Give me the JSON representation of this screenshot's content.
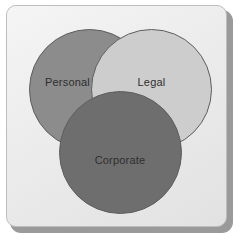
{
  "figure": {
    "type": "venn-diagram",
    "set_count": 3,
    "background_color": "#e9e9e9",
    "frame_border_color": "#bdbdbd",
    "shadow_color": "#9a9a9a",
    "outline_color": "#5e5e5e",
    "label_color": "#2e2e2e"
  },
  "chart_data": {
    "type": "venn",
    "title": "",
    "subtitle": "",
    "xlabel": "",
    "ylabel": "",
    "legend": [],
    "grid": false,
    "sets": [
      {
        "id": "personal",
        "label": "Personal",
        "color": "#8c8c8c",
        "outline": "#5e5e5e",
        "center_x": 89,
        "center_y": 89,
        "radius": 60,
        "z_order": 1
      },
      {
        "id": "legal",
        "label": "Legal",
        "color": "#cdcdcd",
        "outline": "#5e5e5e",
        "center_x": 151,
        "center_y": 89,
        "radius": 60,
        "z_order": 2
      },
      {
        "id": "corporate",
        "label": "Corporate",
        "color": "#6e6e6e",
        "outline": "#5e5e5e",
        "center_x": 120,
        "center_y": 152,
        "radius": 61,
        "z_order": 3
      }
    ],
    "overlaps": [
      {
        "sets": [
          "personal",
          "legal"
        ],
        "label": ""
      },
      {
        "sets": [
          "legal",
          "corporate"
        ],
        "label": ""
      },
      {
        "sets": [
          "personal",
          "corporate"
        ],
        "label": ""
      },
      {
        "sets": [
          "personal",
          "legal",
          "corporate"
        ],
        "label": ""
      }
    ]
  }
}
